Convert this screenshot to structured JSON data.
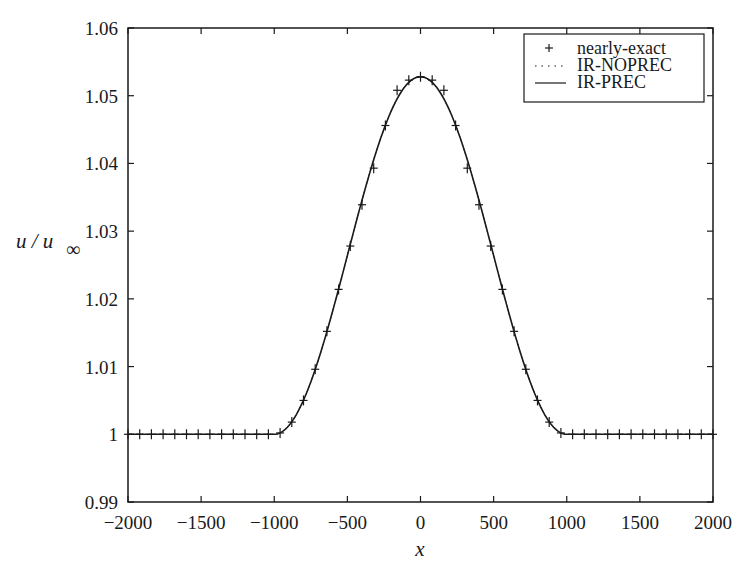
{
  "chart_data": {
    "type": "line",
    "title": "",
    "xlabel": "x",
    "ylabel": "u / u∞",
    "xlim": [
      -2000,
      2000
    ],
    "ylim": [
      0.99,
      1.06
    ],
    "grid": false,
    "legend_position": "upper right",
    "xticks": [
      -2000,
      -1500,
      -1000,
      -500,
      0,
      500,
      1000,
      1500,
      2000
    ],
    "xtick_labels": [
      "−2000",
      "−1500",
      "−1000",
      "−500",
      "0",
      "500",
      "1000",
      "1500",
      "2000"
    ],
    "yticks": [
      0.99,
      1.0,
      1.01,
      1.02,
      1.03,
      1.04,
      1.05,
      1.06
    ],
    "ytick_labels": [
      "0.99",
      "1",
      "1.01",
      "1.02",
      "1.03",
      "1.04",
      "1.05",
      "1.06"
    ],
    "series": [
      {
        "name": "nearly-exact",
        "style": "markers",
        "marker": "+",
        "x": [
          -2000,
          -1920,
          -1840,
          -1760,
          -1680,
          -1600,
          -1520,
          -1440,
          -1360,
          -1280,
          -1200,
          -1120,
          -1040,
          -960,
          -880,
          -800,
          -720,
          -640,
          -560,
          -480,
          -400,
          -320,
          -240,
          -160,
          -80,
          0,
          80,
          160,
          240,
          320,
          400,
          480,
          560,
          640,
          720,
          800,
          880,
          960,
          1040,
          1120,
          1200,
          1280,
          1360,
          1440,
          1520,
          1600,
          1680,
          1760,
          1840,
          1920,
          2000
        ],
        "y": [
          1.0,
          1.0,
          1.0,
          1.0,
          1.0,
          1.0,
          1.0,
          1.0,
          1.0,
          1.0,
          1.0,
          1.0,
          1.0,
          1.0002,
          1.0018,
          1.005,
          1.0096,
          1.0152,
          1.0214,
          1.0278,
          1.0339,
          1.0393,
          1.0456,
          1.0508,
          1.0523,
          1.0528,
          1.0523,
          1.0508,
          1.0456,
          1.0393,
          1.0339,
          1.0278,
          1.0214,
          1.0152,
          1.0096,
          1.005,
          1.0018,
          1.0002,
          1.0,
          1.0,
          1.0,
          1.0,
          1.0,
          1.0,
          1.0,
          1.0,
          1.0,
          1.0,
          1.0,
          1.0,
          1.0
        ]
      },
      {
        "name": "IR-NOPREC",
        "style": "dotted",
        "formula": "1 + 0.0528*cos^2(pi*x/2000) for |x|<1000 else 1"
      },
      {
        "name": "IR-PREC",
        "style": "solid",
        "formula": "1 + 0.0528*cos^2(pi*x/2000) for |x|<1000 else 1"
      }
    ],
    "curve": {
      "amplitude": 0.0528,
      "half_width": 1000,
      "baseline": 1.0
    }
  },
  "legend": {
    "items": [
      {
        "label": "nearly-exact",
        "symbol": "plus"
      },
      {
        "label": "IR-NOPREC",
        "symbol": "dotted-line"
      },
      {
        "label": "IR-PREC",
        "symbol": "solid-line"
      }
    ]
  },
  "colors": {
    "line": "#1a1a1a",
    "background": "#ffffff"
  }
}
